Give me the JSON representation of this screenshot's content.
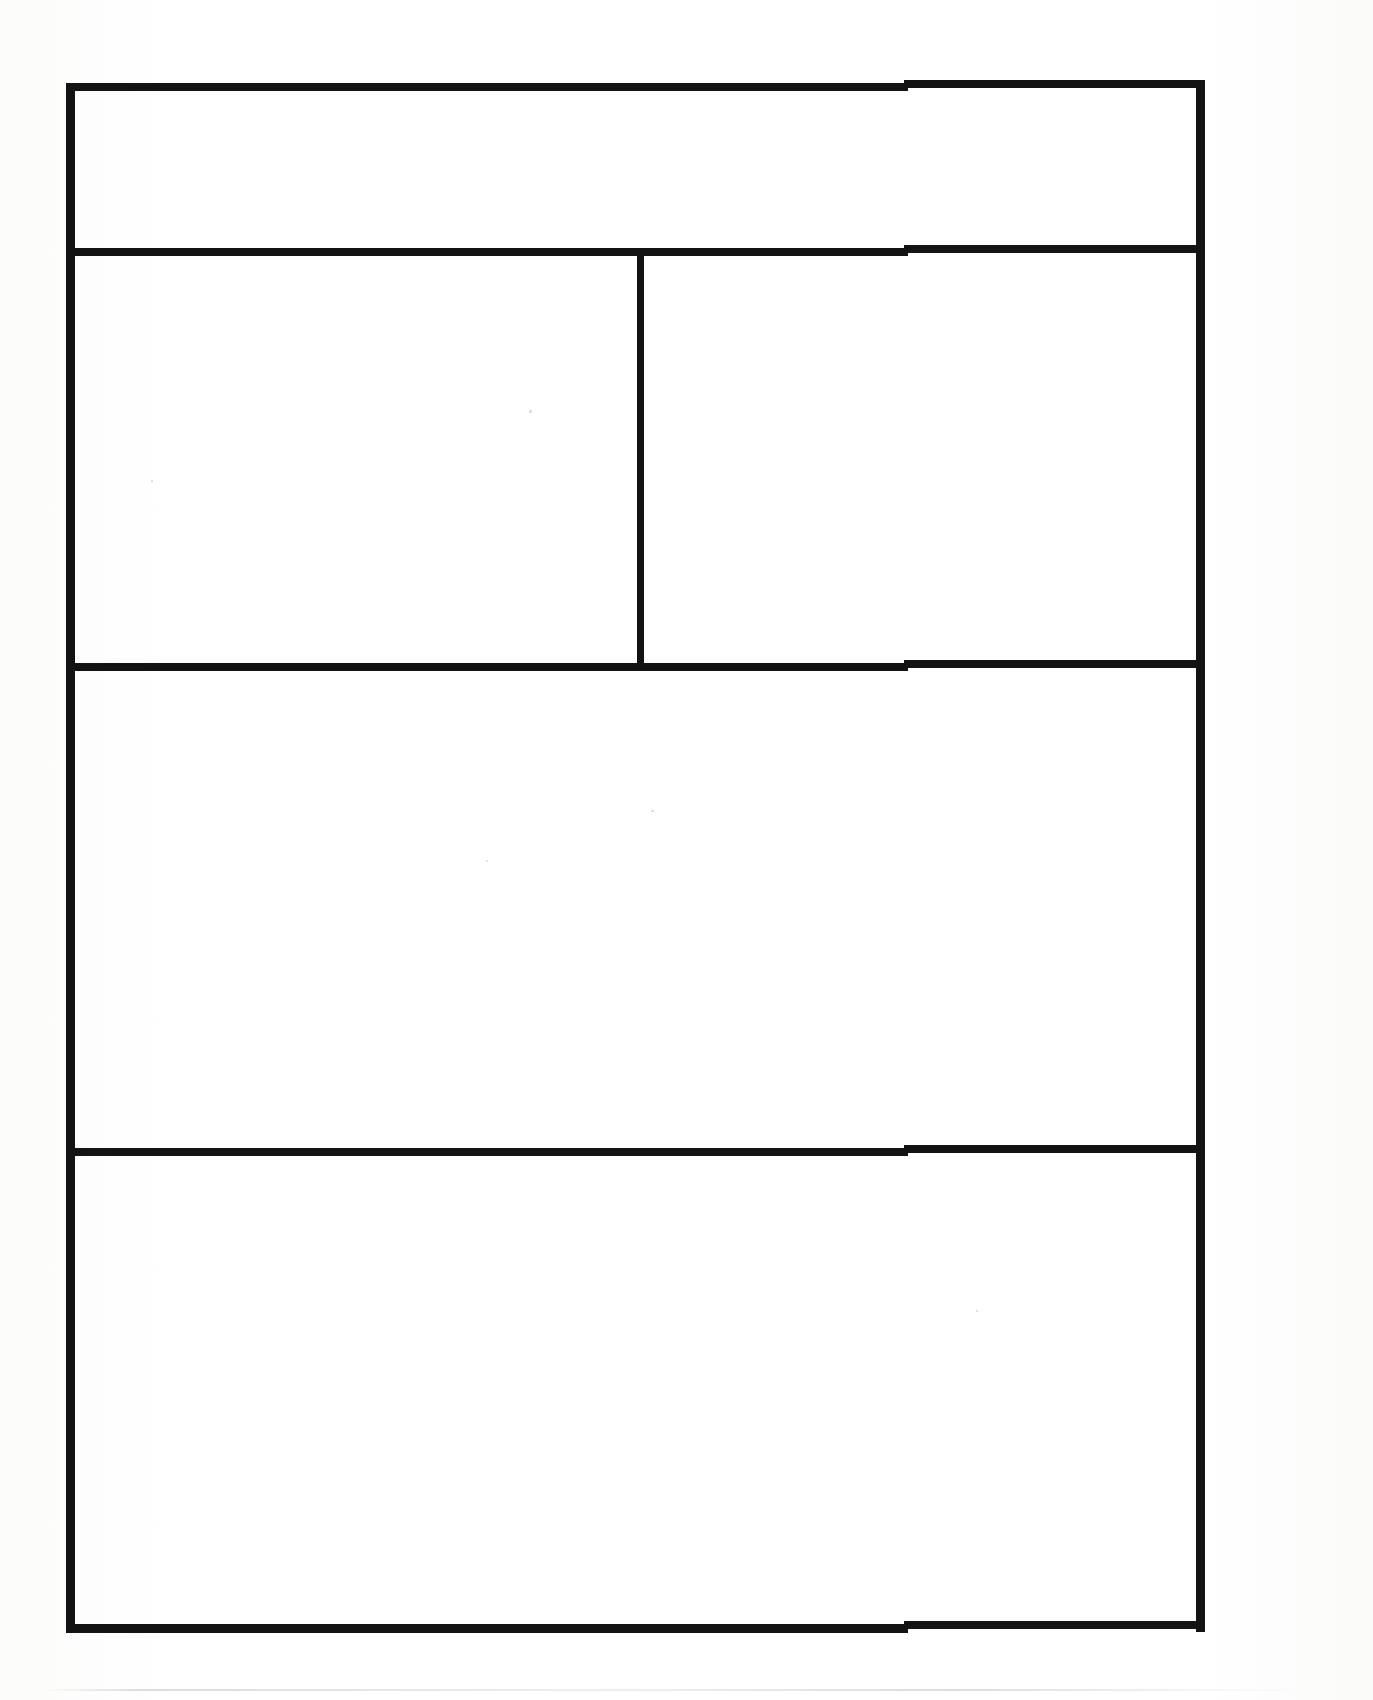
{
  "document": {
    "kind": "scanned-blank-table-form",
    "page_background_color": "#fdfdfc",
    "ink_color": "#131313",
    "title": "",
    "visible_text": "",
    "note": ""
  },
  "table": {
    "name": "blank-form-grid",
    "outer_border_color": "#131313",
    "outer_border_thickness_px": 8,
    "bounds": {
      "left": 66,
      "top": 80,
      "right": 1205,
      "bottom": 1632
    },
    "row_count": 4,
    "rows": [
      {
        "id": "row-1",
        "label": "",
        "top": 80,
        "bottom": 245,
        "cells": [
          {
            "id": "r1c1",
            "label": "",
            "value": "",
            "left": 66,
            "right": 1205
          }
        ]
      },
      {
        "id": "row-2",
        "label": "",
        "top": 245,
        "bottom": 660,
        "cells": [
          {
            "id": "r2c1",
            "label": "",
            "value": "",
            "left": 66,
            "right": 637
          },
          {
            "id": "r2c2",
            "label": "",
            "value": "",
            "left": 637,
            "right": 1205
          }
        ]
      },
      {
        "id": "row-3",
        "label": "",
        "top": 660,
        "bottom": 1145,
        "cells": [
          {
            "id": "r3c1",
            "label": "",
            "value": "",
            "left": 66,
            "right": 1205
          }
        ]
      },
      {
        "id": "row-4",
        "label": "",
        "top": 1145,
        "bottom": 1632,
        "cells": [
          {
            "id": "r4c1",
            "label": "",
            "value": "",
            "left": 66,
            "right": 1205
          }
        ]
      }
    ],
    "dividers": {
      "horizontal_y": [
        245,
        660,
        1145
      ],
      "vertical_x": [
        637
      ],
      "vertical_span_rows": [
        "row-2"
      ]
    }
  },
  "artifacts": {
    "scan_skew_step_x": 905,
    "scan_edge_line_y": 1689
  }
}
